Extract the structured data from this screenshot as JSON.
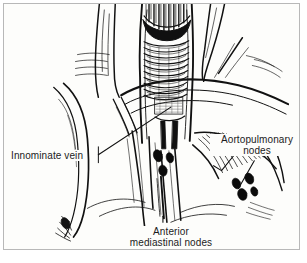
{
  "figure": {
    "background_color": "#fdfdfb",
    "border_color": "#b8b8b8",
    "ink_color": "#111111",
    "text_color": "#1b1b1b"
  },
  "labels": {
    "innominate_vein": {
      "text": "Innominate vein"
    },
    "aortopulmonary_nodes": {
      "line1": "Aortopulmonary",
      "line2": "nodes"
    },
    "anterior_mediastinal_nodes": {
      "line1": "Anterior",
      "line2": "mediastinal nodes"
    }
  },
  "structures": [
    {
      "name": "trachea",
      "description": "cut-open trachea with cartilage rings, dark lumen at top"
    },
    {
      "name": "innominate-vein",
      "description": "long curving vein descending at left"
    },
    {
      "name": "aortic-arch",
      "description": "arch crossing the midline to the right"
    },
    {
      "name": "lymph-nodes",
      "count": 7,
      "color": "#000000"
    },
    {
      "name": "pleura-striations",
      "description": "fine hatched fan-shaped striations"
    }
  ]
}
